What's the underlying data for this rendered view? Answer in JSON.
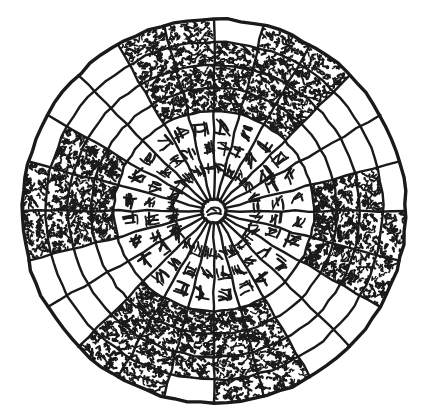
{
  "figure": {
    "medium": "ink line drawing",
    "colors": {
      "ink": "#1a1a1a",
      "background": "#ffffff",
      "fill": "#111111"
    }
  },
  "geometry": {
    "center_x": 214,
    "center_y": 211,
    "outer_radius": 192,
    "ring_radii": [
      192,
      169,
      146,
      123,
      100
    ],
    "inner_disc_radius": 100,
    "hub_radius": 12,
    "sector_count": 24,
    "sector_degrees": 15,
    "ring_count": 4
  },
  "hub": {
    "label": "center-medallion",
    "glyph": "scribble"
  },
  "inner_sectors": [
    {
      "index": 0,
      "angle": -82.5,
      "glyph": "glyph-a"
    },
    {
      "index": 1,
      "angle": -67.5,
      "glyph": "glyph-b"
    },
    {
      "index": 2,
      "angle": -52.5,
      "glyph": "glyph-c"
    },
    {
      "index": 3,
      "angle": -37.5,
      "glyph": "glyph-d"
    },
    {
      "index": 4,
      "angle": -22.5,
      "glyph": "glyph-e"
    },
    {
      "index": 5,
      "angle": -7.5,
      "glyph": "glyph-f"
    },
    {
      "index": 6,
      "angle": 7.5,
      "glyph": "glyph-g"
    },
    {
      "index": 7,
      "angle": 22.5,
      "glyph": "glyph-h"
    },
    {
      "index": 8,
      "angle": 37.5,
      "glyph": "glyph-i"
    },
    {
      "index": 9,
      "angle": 52.5,
      "glyph": "glyph-j"
    },
    {
      "index": 10,
      "angle": 67.5,
      "glyph": "glyph-k"
    },
    {
      "index": 11,
      "angle": 82.5,
      "glyph": "glyph-l"
    },
    {
      "index": 12,
      "angle": 97.5,
      "glyph": "glyph-m"
    },
    {
      "index": 13,
      "angle": 112.5,
      "glyph": "glyph-n"
    },
    {
      "index": 14,
      "angle": 127.5,
      "glyph": "glyph-o"
    },
    {
      "index": 15,
      "angle": 142.5,
      "glyph": "glyph-p"
    },
    {
      "index": 16,
      "angle": 157.5,
      "glyph": "glyph-q"
    },
    {
      "index": 17,
      "angle": 172.5,
      "glyph": "glyph-r"
    },
    {
      "index": 18,
      "angle": 187.5,
      "glyph": "glyph-s"
    },
    {
      "index": 19,
      "angle": 202.5,
      "glyph": "glyph-t"
    },
    {
      "index": 20,
      "angle": 217.5,
      "glyph": "glyph-u"
    },
    {
      "index": 21,
      "angle": 232.5,
      "glyph": "glyph-v"
    },
    {
      "index": 22,
      "angle": 247.5,
      "glyph": "glyph-w"
    },
    {
      "index": 23,
      "angle": 262.5,
      "glyph": "glyph-x"
    }
  ],
  "ring_fill_map": {
    "note": "Per-ring list of 24 booleans; true = cell filled with dense cursive script, false = blank cell. Index 0 starts at the spoke just clockwise of due north (top) and proceeds clockwise.",
    "ring_1_outermost": [
      false,
      true,
      true,
      false,
      false,
      false,
      true,
      true,
      false,
      false,
      true,
      true,
      false,
      true,
      true,
      false,
      false,
      true,
      true,
      false,
      false,
      false,
      true,
      true
    ],
    "ring_2": [
      true,
      true,
      true,
      false,
      false,
      true,
      true,
      true,
      false,
      false,
      true,
      true,
      true,
      true,
      true,
      false,
      false,
      true,
      true,
      true,
      false,
      false,
      true,
      true
    ],
    "ring_3": [
      true,
      true,
      true,
      false,
      false,
      true,
      true,
      true,
      false,
      false,
      true,
      true,
      true,
      true,
      true,
      false,
      false,
      true,
      true,
      true,
      false,
      false,
      true,
      true
    ],
    "ring_4_innermost": [
      true,
      true,
      true,
      false,
      false,
      true,
      true,
      true,
      false,
      false,
      true,
      true,
      true,
      true,
      true,
      false,
      false,
      true,
      true,
      true,
      false,
      false,
      true,
      true
    ]
  }
}
